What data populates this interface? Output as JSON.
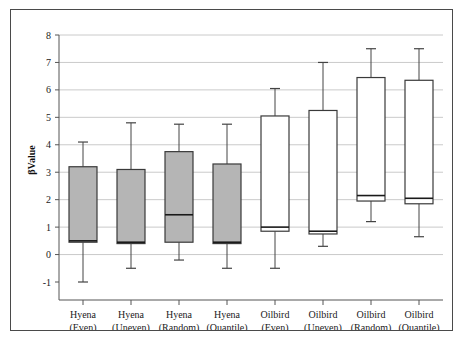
{
  "chart_data": {
    "type": "box",
    "title": "",
    "xlabel": "",
    "ylabel": "βValue",
    "ylim": [
      -1,
      8
    ],
    "ytick_labels": [
      "8",
      "7",
      "6",
      "5",
      "4",
      "3",
      "2",
      "1",
      "0",
      "-1"
    ],
    "yticks": [
      8,
      7,
      6,
      5,
      4,
      3,
      2,
      1,
      0,
      -1
    ],
    "grid": true,
    "legend": "none",
    "categories": [
      "Hyena (Even)",
      "Hyena (Uneven)",
      "Hyena (Random)",
      "Hyena (Quantile)",
      "Oilbird (Even)",
      "Oilbird (Uneven)",
      "Oilbird (Random)",
      "Oilbird (Quantile)"
    ],
    "category_lines": [
      [
        "Hyena",
        "(Even)"
      ],
      [
        "Hyena",
        "(Uneven)"
      ],
      [
        "Hyena",
        "(Random)"
      ],
      [
        "Hyena",
        "(Quantile)"
      ],
      [
        "Oilbird",
        "(Even)"
      ],
      [
        "Oilbird",
        "(Uneven)"
      ],
      [
        "Oilbird",
        "(Random)"
      ],
      [
        "Oilbird",
        "(Quantile)"
      ]
    ],
    "boxes": [
      {
        "category": "Hyena (Even)",
        "min": -1.0,
        "q1": 0.45,
        "median": 0.5,
        "q3": 3.2,
        "max": 4.1,
        "fill": "#b5b5b5"
      },
      {
        "category": "Hyena (Uneven)",
        "min": -0.5,
        "q1": 0.4,
        "median": 0.45,
        "q3": 3.1,
        "max": 4.8,
        "fill": "#b5b5b5"
      },
      {
        "category": "Hyena (Random)",
        "min": -0.2,
        "q1": 0.45,
        "median": 1.45,
        "q3": 3.75,
        "max": 4.75,
        "fill": "#b5b5b5"
      },
      {
        "category": "Hyena (Quantile)",
        "min": -0.5,
        "q1": 0.4,
        "median": 0.45,
        "q3": 3.3,
        "max": 4.75,
        "fill": "#b5b5b5"
      },
      {
        "category": "Oilbird (Even)",
        "min": -0.5,
        "q1": 0.85,
        "median": 1.0,
        "q3": 5.05,
        "max": 6.05,
        "fill": "#ffffff"
      },
      {
        "category": "Oilbird (Uneven)",
        "min": 0.3,
        "q1": 0.75,
        "median": 0.85,
        "q3": 5.25,
        "max": 7.0,
        "fill": "#ffffff"
      },
      {
        "category": "Oilbird (Random)",
        "min": 1.2,
        "q1": 1.95,
        "median": 2.15,
        "q3": 6.45,
        "max": 7.5,
        "fill": "#ffffff"
      },
      {
        "category": "Oilbird (Quantile)",
        "min": 0.65,
        "q1": 1.85,
        "median": 2.05,
        "q3": 6.35,
        "max": 7.5,
        "fill": "#ffffff"
      }
    ],
    "colors": {
      "hyena_fill": "#b5b5b5",
      "oilbird_fill": "#ffffff",
      "box_stroke": "#3a3a3a",
      "grid": "#bdbdbd",
      "axis": "#555555",
      "text": "#1a1a1a"
    }
  }
}
